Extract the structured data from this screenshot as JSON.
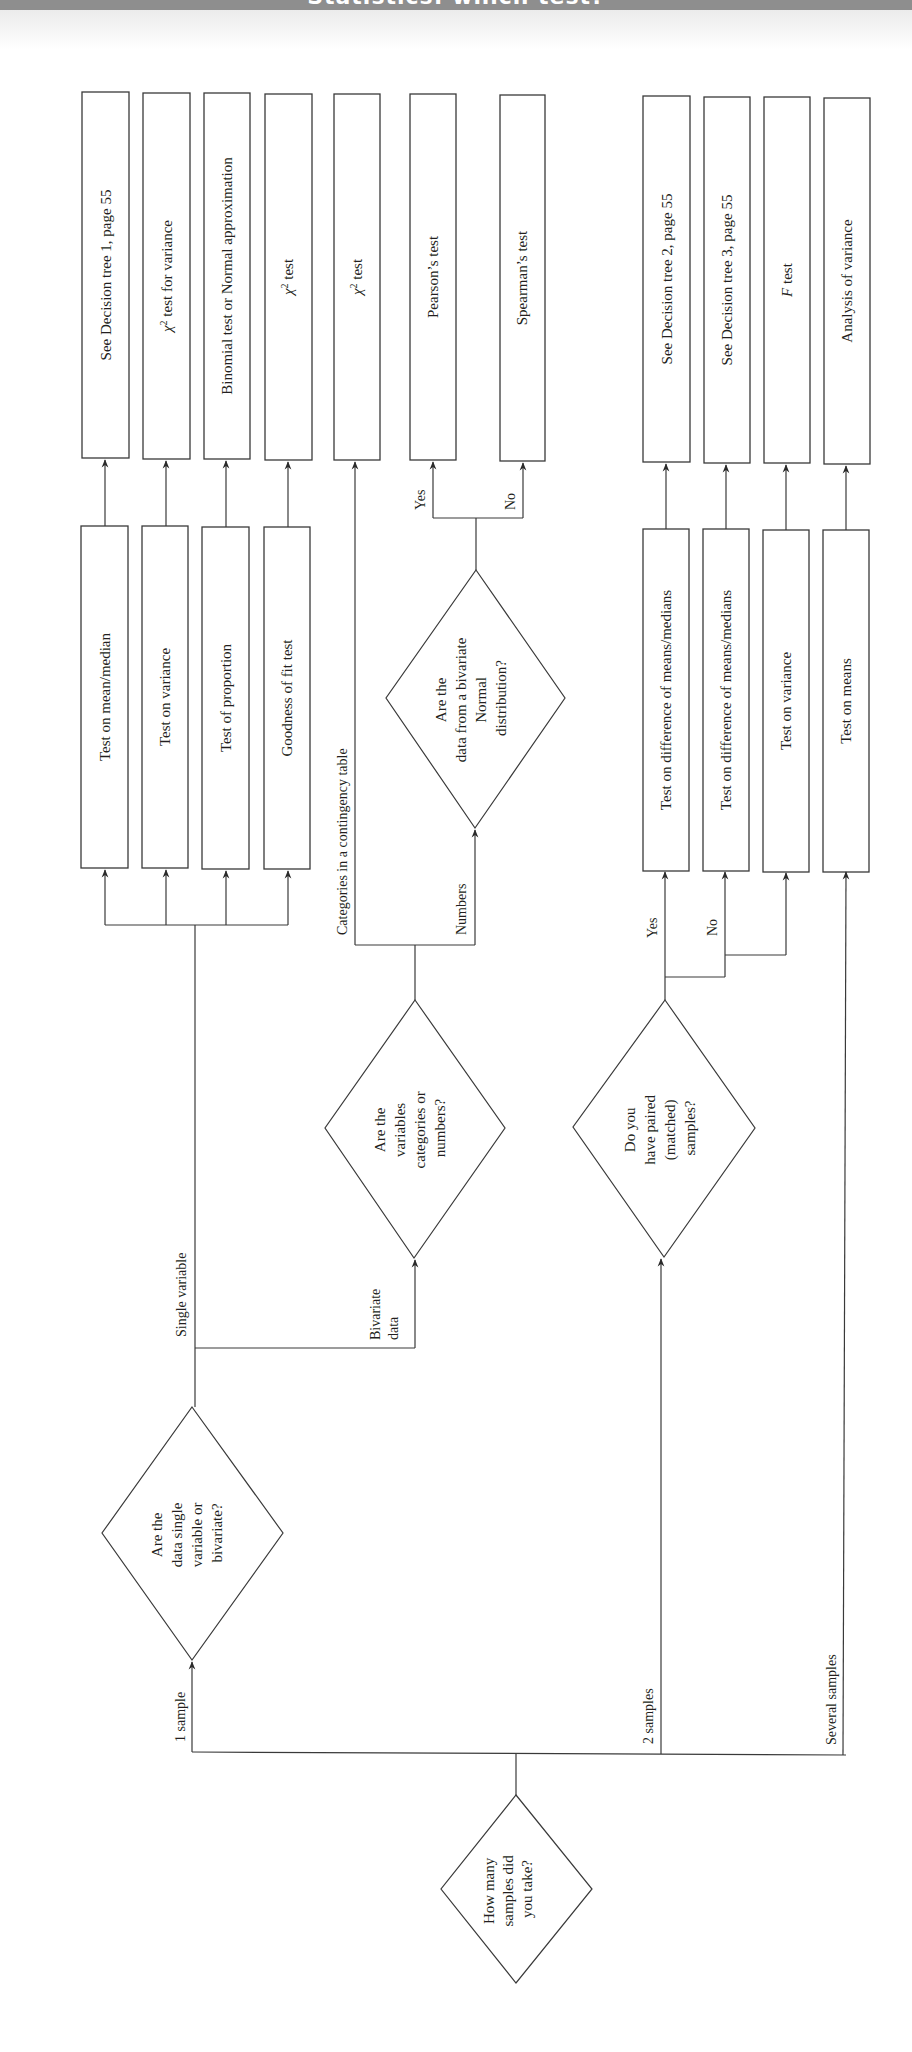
{
  "header": {
    "title": "Statistics: which test?",
    "bar_color": "#8e8e8e"
  },
  "diagram": {
    "orientation": "rotated-90-ccw",
    "start_node": {
      "id": "how-many-samples",
      "lines": [
        "How many",
        "samples did",
        "you take?"
      ]
    },
    "decisions": {
      "single_or_bivariate": {
        "lines": [
          "Are the",
          "data single",
          "variable or",
          "bivariate?"
        ]
      },
      "categories_or_numbers": {
        "lines": [
          "Are the",
          "variables",
          "categories or",
          "numbers?"
        ]
      },
      "bivariate_normal": {
        "lines": [
          "Are the",
          "data from a bivariate",
          "Normal",
          "distribution?"
        ]
      },
      "paired": {
        "lines": [
          "Do you",
          "have paired",
          "(matched)",
          "samples?"
        ]
      }
    },
    "edge_labels": {
      "one_sample": "1 sample",
      "two_samples": "2 samples",
      "several_samples": "Several samples",
      "single_variable": "Single variable",
      "bivariate_data_1": "Bivariate",
      "bivariate_data_2": "data",
      "categories": "Categories in a contingency table",
      "numbers": "Numbers",
      "normal_yes": "Yes",
      "normal_no": "No",
      "paired_yes": "Yes",
      "paired_no": "No"
    },
    "intermediate_boxes": {
      "mean_median": "Test on mean/median",
      "variance_single": "Test on variance",
      "proportion": "Test of proportion",
      "goodness_of_fit": "Goodness of fit test",
      "diff_paired": "Test on difference of means/medians",
      "diff_unpaired": "Test on difference of means/medians",
      "variance_two": "Test on variance",
      "means_several": "Test on means"
    },
    "outcome_boxes": {
      "tree1": "See Decision tree 1, page 55",
      "chi_variance_symbol": "χ",
      "chi_variance_sup": "2",
      "chi_variance_rest": " test for variance",
      "binomial": "Binomial test or Normal approximation",
      "chi_gof_symbol": "χ",
      "chi_gof_sup": "2",
      "chi_gof_rest": " test",
      "chi_contingency_symbol": "χ",
      "chi_contingency_sup": "2",
      "chi_contingency_rest": " test",
      "pearson": "Pearson’s test",
      "spearman": "Spearman’s test",
      "tree2": "See Decision tree 2, page 55",
      "tree3": "See Decision tree 3, page 55",
      "f_symbol": "F",
      "f_rest": " test",
      "anova": "Analysis of variance"
    }
  }
}
